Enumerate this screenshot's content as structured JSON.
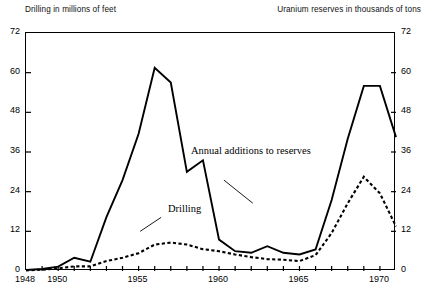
{
  "header": {
    "left_label": "Drilling in millions of feet",
    "right_label": "Uranium reserves in thousands of tons"
  },
  "annotations": {
    "reserves": "Annual additions to reserves",
    "drilling": "Drilling"
  },
  "axes": {
    "y_left_ticks": [
      "0",
      "12",
      "24",
      "36",
      "48",
      "60",
      "72"
    ],
    "y_right_ticks": [
      "0",
      "12",
      "24",
      "36",
      "48",
      "60",
      "72"
    ],
    "x_ticks_labeled": [
      "1948",
      "1950",
      "1955",
      "1960",
      "1965",
      "1970"
    ]
  },
  "chart_data": {
    "type": "line",
    "title": "",
    "subtitle": "",
    "xlabel": "",
    "ylabel": "Drilling in millions of feet",
    "ylabel_right": "Uranium reserves in thousands of tons",
    "xlim": [
      1948,
      1971
    ],
    "ylim": [
      0,
      72
    ],
    "ytick_values": [
      0,
      12,
      24,
      36,
      48,
      60,
      72
    ],
    "xtick_values": [
      1948,
      1949,
      1950,
      1951,
      1952,
      1953,
      1954,
      1955,
      1956,
      1957,
      1958,
      1959,
      1960,
      1961,
      1962,
      1963,
      1964,
      1965,
      1966,
      1967,
      1968,
      1969,
      1970,
      1971
    ],
    "xtick_labeled_values": [
      1948,
      1950,
      1955,
      1960,
      1965,
      1970
    ],
    "grid": false,
    "legend": "inline-annotations",
    "x": [
      1948,
      1949,
      1950,
      1951,
      1952,
      1953,
      1954,
      1955,
      1956,
      1957,
      1958,
      1959,
      1960,
      1961,
      1962,
      1963,
      1964,
      1965,
      1966,
      1967,
      1968,
      1969,
      1970,
      1971
    ],
    "series": [
      {
        "name": "Annual additions to reserves",
        "style": "solid",
        "axis": "right",
        "units": "thousands of tons",
        "values": [
          0.3,
          0.6,
          1.3,
          4.0,
          2.8,
          16.3,
          27.5,
          41.5,
          61.5,
          57.0,
          30.0,
          33.5,
          9.5,
          6.0,
          5.5,
          7.5,
          5.5,
          5.0,
          6.5,
          21.5,
          40.0,
          56.0,
          56.0,
          40.5
        ]
      },
      {
        "name": "Drilling",
        "style": "dotted",
        "axis": "left",
        "units": "millions of feet",
        "values": [
          0.2,
          0.4,
          0.8,
          1.4,
          1.4,
          3.0,
          4.0,
          5.4,
          8.0,
          8.6,
          8.0,
          6.6,
          6.0,
          5.0,
          4.2,
          3.6,
          3.4,
          3.0,
          4.8,
          11.5,
          20.5,
          28.5,
          23.5,
          13.5
        ]
      }
    ]
  }
}
